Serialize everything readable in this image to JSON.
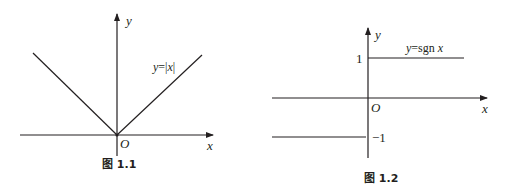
{
  "figures": [
    {
      "id": "fig-1-1",
      "caption": "图 1.1",
      "function_label_parts": [
        "y",
        "=|",
        "x",
        "|"
      ],
      "x_axis_label": "x",
      "y_axis_label": "y",
      "origin_label": "O",
      "function": "y=|x|"
    },
    {
      "id": "fig-1-2",
      "caption": "图 1.2",
      "function_label_parts": [
        "y",
        "=sgn ",
        "x"
      ],
      "x_axis_label": "x",
      "y_axis_label": "y",
      "origin_label": "O",
      "tick_labels": [
        "1",
        "−1"
      ],
      "function": "y=sgn x"
    }
  ],
  "colors": {
    "ink": "#231f20",
    "background": "#ffffff"
  }
}
